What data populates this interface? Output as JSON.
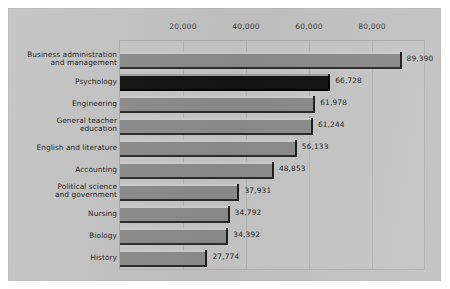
{
  "chart_data": {
    "type": "bar",
    "orientation": "horizontal",
    "title": "",
    "subtitle": "",
    "xlabel": "",
    "ylabel": "",
    "xlim": [
      0,
      100000
    ],
    "grid": true,
    "legend": "none",
    "highlight_category": "Psychology",
    "axis": {
      "ticks": [
        {
          "value": 20000,
          "label": "20,000"
        },
        {
          "value": 40000,
          "label": "40,000"
        },
        {
          "value": 60000,
          "label": "60,000"
        },
        {
          "value": 80000,
          "label": "80,000"
        }
      ]
    },
    "categories": [
      "Business administration and management",
      "Psychology",
      "Engineering",
      "General teacher education",
      "English and literature",
      "Accounting",
      "Political science and government",
      "Nursing",
      "Biology",
      "History"
    ],
    "values": [
      89390,
      66728,
      61978,
      61244,
      56133,
      48853,
      37931,
      34792,
      34392,
      27774
    ],
    "value_labels": [
      "89,390",
      "66,728",
      "61,978",
      "61,244",
      "56,133",
      "48,853",
      "37,931",
      "34,792",
      "34,392",
      "27,774"
    ]
  },
  "bars": [
    {
      "label_line1": "Business administration",
      "label_line2": "and management",
      "value": 89390,
      "value_label": "89,390",
      "highlight": false
    },
    {
      "label_line1": "Psychology",
      "label_line2": "",
      "value": 66728,
      "value_label": "66,728",
      "highlight": true
    },
    {
      "label_line1": "Engineering",
      "label_line2": "",
      "value": 61978,
      "value_label": "61,978",
      "highlight": false
    },
    {
      "label_line1": "General teacher",
      "label_line2": "education",
      "value": 61244,
      "value_label": "61,244",
      "highlight": false
    },
    {
      "label_line1": "English and literature",
      "label_line2": "",
      "value": 56133,
      "value_label": "56,133",
      "highlight": false
    },
    {
      "label_line1": "Accounting",
      "label_line2": "",
      "value": 48853,
      "value_label": "48,853",
      "highlight": false
    },
    {
      "label_line1": "Political science",
      "label_line2": "and government",
      "value": 37931,
      "value_label": "37,931",
      "highlight": false
    },
    {
      "label_line1": "Nursing",
      "label_line2": "",
      "value": 34792,
      "value_label": "34,792",
      "highlight": false
    },
    {
      "label_line1": "Biology",
      "label_line2": "",
      "value": 34392,
      "value_label": "34,392",
      "highlight": false
    },
    {
      "label_line1": "History",
      "label_line2": "",
      "value": 27774,
      "value_label": "27,774",
      "highlight": false
    }
  ],
  "colors": {
    "page_background": "#ffffff",
    "panel_background": "#c3c3c3",
    "plot_background": "#c6c6c6",
    "bar_fill": "#8c8c8c",
    "bar_highlight_fill": "#131313",
    "gridline": "#b6b6b6",
    "frame": "#a9a9a9",
    "label_text": "#1d1d1d",
    "tick_text": "#3a3a3a"
  }
}
